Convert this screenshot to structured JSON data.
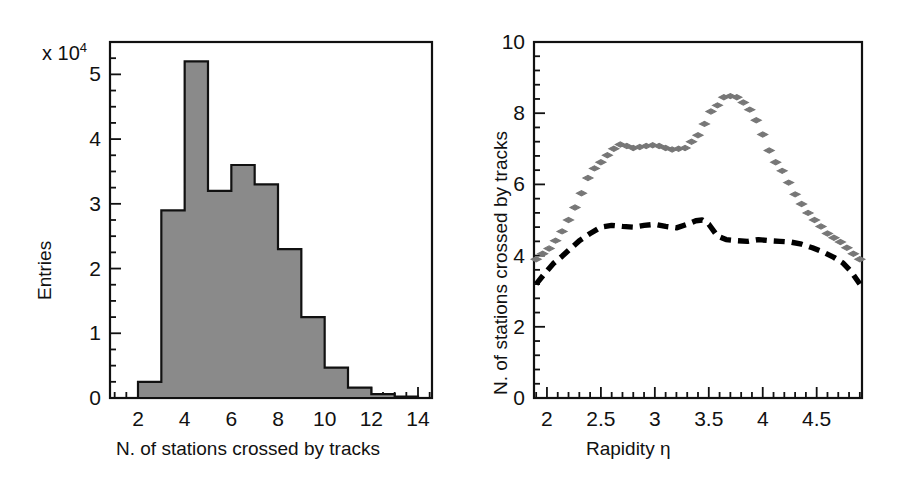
{
  "figure": {
    "width": 900,
    "height": 489,
    "background": "#ffffff"
  },
  "chart_data": [
    {
      "id": "left-histogram",
      "type": "bar",
      "title": "",
      "xlabel": "N. of stations crossed by tracks",
      "ylabel": "Entries",
      "y_multiplier_label": "x 10",
      "y_multiplier_exponent": "4",
      "xlim": [
        0.8,
        14.6
      ],
      "ylim": [
        0,
        5.5
      ],
      "xticks": [
        2,
        4,
        6,
        8,
        10,
        12,
        14
      ],
      "xtick_labels": [
        "2",
        "4",
        "6",
        "8",
        "10",
        "12",
        "14"
      ],
      "yticks": [
        0,
        1,
        2,
        3,
        4,
        5
      ],
      "ytick_labels": [
        "0",
        "1",
        "2",
        "3",
        "4",
        "5"
      ],
      "x_minor_tick_step": 0.5,
      "y_minor_tick_step": 0.25,
      "grid": false,
      "legend": "none",
      "bin_width": 1,
      "bin_centers": [
        2.5,
        3.5,
        4.5,
        5.5,
        6.5,
        7.5,
        8.5,
        9.5,
        10.5,
        11.5,
        12.5,
        13.5
      ],
      "categories": [
        "2.5",
        "3.5",
        "4.5",
        "5.5",
        "6.5",
        "7.5",
        "8.5",
        "9.5",
        "10.5",
        "11.5",
        "12.5",
        "13.5"
      ],
      "values": [
        0.25,
        2.9,
        5.2,
        3.2,
        3.6,
        3.3,
        2.3,
        1.25,
        0.47,
        0.16,
        0.06,
        0.02
      ],
      "fill_color": "#8a8a8a",
      "edge_color": "#111111"
    },
    {
      "id": "right-profile",
      "type": "scatter",
      "title": "",
      "xlabel": "Rapidity  η",
      "ylabel": "N. of stations crossed by tracks",
      "xlim": [
        1.88,
        4.92
      ],
      "ylim": [
        0,
        10
      ],
      "xticks": [
        2,
        2.5,
        3,
        3.5,
        4,
        4.5
      ],
      "xtick_labels": [
        "2",
        "2.5",
        "3",
        "3.5",
        "4",
        "4.5"
      ],
      "yticks": [
        0,
        2,
        4,
        6,
        8,
        10
      ],
      "ytick_labels": [
        "0",
        "2",
        "4",
        "6",
        "8",
        "10"
      ],
      "x_minor_tick_step": 0.1,
      "y_minor_tick_step": 0.4,
      "grid": false,
      "legend": "none",
      "series": [
        {
          "name": "markers",
          "style": "diamond-markers",
          "color": "#777777",
          "x": [
            1.9,
            1.96,
            2.02,
            2.08,
            2.14,
            2.2,
            2.26,
            2.32,
            2.38,
            2.44,
            2.5,
            2.56,
            2.62,
            2.68,
            2.74,
            2.8,
            2.86,
            2.92,
            2.98,
            3.04,
            3.1,
            3.16,
            3.22,
            3.28,
            3.34,
            3.4,
            3.46,
            3.52,
            3.58,
            3.64,
            3.7,
            3.76,
            3.82,
            3.88,
            3.94,
            4.0,
            4.06,
            4.12,
            4.18,
            4.24,
            4.3,
            4.36,
            4.42,
            4.48,
            4.54,
            4.6,
            4.66,
            4.72,
            4.78,
            4.84,
            4.9
          ],
          "y": [
            3.9,
            4.05,
            4.2,
            4.42,
            4.68,
            5.0,
            5.35,
            5.75,
            6.18,
            6.45,
            6.62,
            6.82,
            7.0,
            7.12,
            7.08,
            7.02,
            7.05,
            7.08,
            7.1,
            7.08,
            7.02,
            6.98,
            7.0,
            7.02,
            7.2,
            7.38,
            7.7,
            8.05,
            8.22,
            8.45,
            8.48,
            8.45,
            8.3,
            8.1,
            7.8,
            7.4,
            6.95,
            6.62,
            6.38,
            6.05,
            5.72,
            5.45,
            5.2,
            5.0,
            4.82,
            4.62,
            4.5,
            4.38,
            4.22,
            4.05,
            3.9
          ]
        },
        {
          "name": "dashed-line",
          "style": "thick-dashed",
          "color": "#000000",
          "x": [
            1.9,
            1.98,
            2.06,
            2.14,
            2.22,
            2.3,
            2.4,
            2.5,
            2.6,
            2.7,
            2.8,
            2.9,
            3.0,
            3.1,
            3.2,
            3.3,
            3.38,
            3.44,
            3.5,
            3.58,
            3.66,
            3.76,
            3.86,
            3.96,
            4.06,
            4.16,
            4.26,
            4.36,
            4.46,
            4.56,
            4.66,
            4.74,
            4.82,
            4.9
          ],
          "y": [
            3.2,
            3.5,
            3.78,
            3.98,
            4.2,
            4.42,
            4.62,
            4.8,
            4.85,
            4.82,
            4.8,
            4.85,
            4.88,
            4.82,
            4.78,
            4.88,
            4.98,
            5.0,
            4.88,
            4.55,
            4.45,
            4.42,
            4.4,
            4.45,
            4.42,
            4.4,
            4.38,
            4.32,
            4.22,
            4.1,
            3.95,
            3.8,
            3.55,
            3.2
          ]
        }
      ]
    }
  ]
}
